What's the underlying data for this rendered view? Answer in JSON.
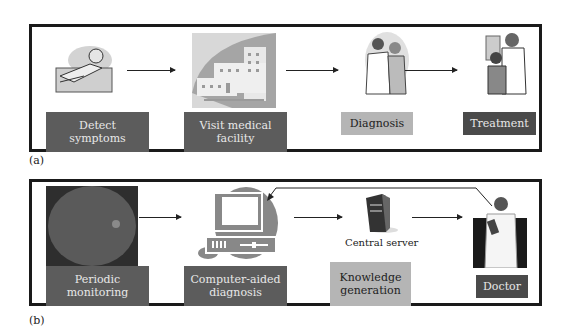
{
  "panel_a": {
    "caption": "(a)",
    "steps": [
      {
        "label": "Detect symptoms",
        "icon": "sick-person-icon"
      },
      {
        "label": "Visit medical facility",
        "icon": "hospital-building-icon"
      },
      {
        "label": "Diagnosis",
        "icon": "doctor-examining-patient-icon"
      },
      {
        "label": "Treatment",
        "icon": "doctor-with-child-icon"
      }
    ]
  },
  "panel_b": {
    "caption": "(b)",
    "steps": [
      {
        "label": "Periodic monitoring",
        "icon": "retina-fundus-image-icon"
      },
      {
        "label": "Computer-aided diagnosis",
        "icon": "computer-icon"
      },
      {
        "label": "Knowledge generation",
        "icon": "server-tower-icon",
        "sublabel": "Central server"
      },
      {
        "label": "Doctor",
        "icon": "doctor-icon"
      }
    ]
  }
}
